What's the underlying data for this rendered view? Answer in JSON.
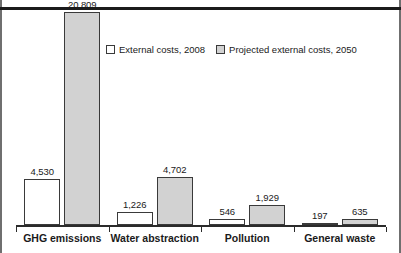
{
  "figure": {
    "clipped_caption_fragment": "",
    "background_color": "#ffffff",
    "rule_color": "#1b1b1b",
    "page_rule_color": "#6f6f6f"
  },
  "legend": {
    "position": "inside-top-center",
    "items": [
      {
        "label": "External costs, 2008",
        "swatch": "white-square-swatch",
        "color": "#ffffff"
      },
      {
        "label": "Projected external costs, 2050",
        "swatch": "gray-square-swatch",
        "color": "#d2d2d2"
      }
    ]
  },
  "chart_data": {
    "type": "bar",
    "title": "",
    "subtitle": "",
    "xlabel": "",
    "ylabel": "",
    "grid": false,
    "legend_position": "inside-top-center",
    "ylim": [
      0,
      20809
    ],
    "categories": [
      "GHG emissions",
      "Water abstraction",
      "Pollution",
      "General waste"
    ],
    "series": [
      {
        "name": "External costs, 2008",
        "color": "#ffffff",
        "values": [
          4530,
          1226,
          546,
          197
        ],
        "labels": [
          "4,530",
          "1,226",
          "546",
          "197"
        ]
      },
      {
        "name": "Projected external costs, 2050",
        "color": "#d2d2d2",
        "values": [
          20809,
          4702,
          1929,
          635
        ],
        "labels": [
          "20,809",
          "4,702",
          "1,929",
          "635"
        ]
      }
    ]
  }
}
